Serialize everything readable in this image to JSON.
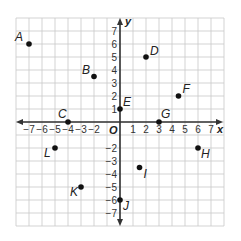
{
  "chart_data": {
    "type": "scatter",
    "title": "",
    "xlabel": "x",
    "ylabel": "y",
    "origin_label": "O",
    "xlim": [
      -8,
      8
    ],
    "ylim": [
      -8,
      8
    ],
    "grid": true,
    "x_ticks": [
      -7,
      -6,
      -5,
      -4,
      -3,
      -2,
      1,
      2,
      3,
      4,
      5,
      6,
      7
    ],
    "y_ticks": [
      7,
      6,
      5,
      4,
      3,
      2,
      1,
      -2,
      -3,
      -4,
      -5,
      -6,
      -7
    ],
    "points": [
      {
        "label": "A",
        "x": -7,
        "y": 6,
        "label_dx": -14,
        "label_dy": -3
      },
      {
        "label": "B",
        "x": -2,
        "y": 3.5,
        "label_dx": -12,
        "label_dy": -3
      },
      {
        "label": "C",
        "x": -4,
        "y": 0,
        "label_dx": -10,
        "label_dy": -4
      },
      {
        "label": "D",
        "x": 2,
        "y": 5,
        "label_dx": 4,
        "label_dy": -2
      },
      {
        "label": "E",
        "x": 0,
        "y": 1,
        "label_dx": 3,
        "label_dy": -3
      },
      {
        "label": "F",
        "x": 4.5,
        "y": 2,
        "label_dx": 4,
        "label_dy": -3
      },
      {
        "label": "G",
        "x": 3,
        "y": 0,
        "label_dx": 2,
        "label_dy": -4
      },
      {
        "label": "H",
        "x": 6,
        "y": -2,
        "label_dx": 3,
        "label_dy": 10
      },
      {
        "label": "I",
        "x": 1.5,
        "y": -3.5,
        "label_dx": 4,
        "label_dy": 10
      },
      {
        "label": "J",
        "x": 0,
        "y": -6,
        "label_dx": 3,
        "label_dy": 10
      },
      {
        "label": "K",
        "x": -3,
        "y": -5,
        "label_dx": -11,
        "label_dy": 9
      },
      {
        "label": "L",
        "x": -5,
        "y": -2,
        "label_dx": -11,
        "label_dy": 9
      }
    ],
    "colors": {
      "grid": "#c8c8c8",
      "axis": "#333333",
      "point": "#111111"
    }
  }
}
